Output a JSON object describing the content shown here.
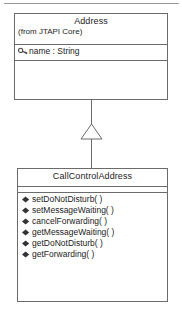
{
  "diagram": {
    "type": "uml-class-diagram",
    "title": "",
    "page_rule": true,
    "colors": {
      "line": "#6b6b6b",
      "text": "#1c1c1c",
      "background": "#ffffff",
      "rule": "#9a9a9a"
    },
    "classes": [
      {
        "id": "address",
        "name": "Address",
        "stereotype": "(from JTAPI Core)",
        "attributes": [
          {
            "visibility_icon": "key-icon",
            "label": "name : String"
          }
        ],
        "operations": []
      },
      {
        "id": "callcontroladdress",
        "name": "CallControlAddress",
        "stereotype": "",
        "attributes": [],
        "operations": [
          {
            "visibility_icon": "filled-diamond-icon",
            "label": "setDoNotDisturb( )"
          },
          {
            "visibility_icon": "filled-diamond-icon",
            "label": "setMessageWaiting( )"
          },
          {
            "visibility_icon": "filled-diamond-icon",
            "label": "cancelForwarding( )"
          },
          {
            "visibility_icon": "filled-diamond-icon",
            "label": "getMessageWaiting( )"
          },
          {
            "visibility_icon": "filled-diamond-icon",
            "label": "getDoNotDisturb( )"
          },
          {
            "visibility_icon": "filled-diamond-icon",
            "label": "getForwarding( )"
          }
        ]
      }
    ],
    "relationships": [
      {
        "kind": "generalization",
        "from": "CallControlAddress",
        "to": "Address",
        "arrow": "hollow-triangle"
      }
    ]
  }
}
